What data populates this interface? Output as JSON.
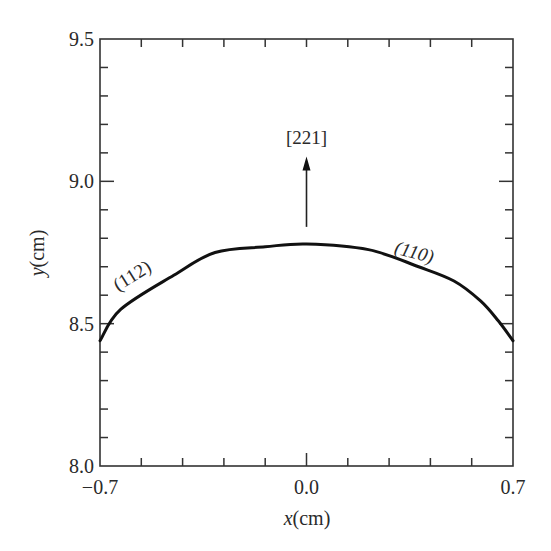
{
  "chart_data": {
    "type": "line",
    "title": "",
    "xlabel": {
      "var": "x",
      "unit": "(cm)"
    },
    "ylabel": {
      "var": "y",
      "unit": "(cm)"
    },
    "xlim": [
      -0.7,
      0.7
    ],
    "ylim": [
      8.0,
      9.5
    ],
    "x_ticks": [
      -0.7,
      0.0,
      0.7
    ],
    "x_tick_labels": [
      "−0.7",
      "0.0",
      "0.7"
    ],
    "x_minor_divisions": 10,
    "y_ticks": [
      8.0,
      8.5,
      9.0,
      9.5
    ],
    "y_tick_labels": [
      "8.0",
      "8.5",
      "9.0",
      "9.5"
    ],
    "y_minor_divisions": 5,
    "grid": false,
    "legend": null,
    "series": [
      {
        "name": "crystal profile",
        "x": [
          -0.7,
          -0.63,
          -0.45,
          -0.31,
          -0.14,
          0.0,
          0.21,
          0.38,
          0.5,
          0.59,
          0.65,
          0.7
        ],
        "y": [
          8.44,
          8.55,
          8.67,
          8.75,
          8.77,
          8.78,
          8.76,
          8.7,
          8.65,
          8.58,
          8.51,
          8.44
        ],
        "color": "#111111"
      }
    ],
    "annotations": [
      {
        "text": "(112)",
        "x": -0.58,
        "y": 8.65,
        "rotation": -32,
        "style": "normal"
      },
      {
        "text": "(110)",
        "x": 0.36,
        "y": 8.73,
        "rotation": 15,
        "style": "italic"
      },
      {
        "text": "[221]",
        "x": 0.0,
        "y": 9.13,
        "rotation": 0,
        "style": "normal"
      }
    ],
    "arrow": {
      "x": 0.0,
      "y_start": 8.84,
      "y_end": 9.08,
      "label": "[221]"
    }
  },
  "colors": {
    "axis": "#333333",
    "curve": "#111111",
    "text": "#2a2a2a",
    "background": "#ffffff"
  }
}
